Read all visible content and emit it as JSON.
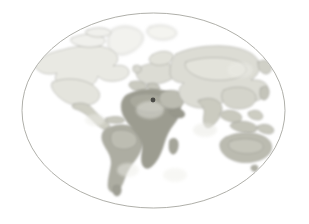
{
  "figure": {
    "kind": "world-map",
    "projection": "elliptical",
    "style": "watercolor-grayscale",
    "canvas": {
      "width": 309,
      "height": 224
    },
    "background_color": "#ffffff"
  },
  "frame": {
    "shape": "ellipse",
    "center_x": 153.5,
    "center_y": 110.5,
    "radius_x": 131.5,
    "radius_y": 97.5,
    "stroke_color": "#9a9a93",
    "stroke_width": 0.8,
    "fill": "none"
  },
  "palette": {
    "ocean": "#ffffff",
    "coastline": "#8d8d86",
    "land_faintest": "#f2f2ee",
    "land_faint": "#e8e8e2",
    "land_light": "#deded6",
    "land_medium": "#cfcfc5",
    "land_mediumdark": "#bcbcb0",
    "land_dark": "#ababa0",
    "land_darkest": "#9a9a8e",
    "marker": "#4a4a46"
  },
  "regions": [
    {
      "name": "North America",
      "tone": "land_faint",
      "tone_hex": "#e8e8e2"
    },
    {
      "name": "Greenland",
      "tone": "land_faintest",
      "tone_hex": "#f2f2ee"
    },
    {
      "name": "South America",
      "tone": "land_dark",
      "tone_hex": "#ababa0"
    },
    {
      "name": "Europe",
      "tone": "land_light",
      "tone_hex": "#deded6"
    },
    {
      "name": "Africa",
      "tone": "land_darkest",
      "tone_hex": "#9a9a8e"
    },
    {
      "name": "Asia",
      "tone": "land_light",
      "tone_hex": "#deded6"
    },
    {
      "name": "Southeast Asia",
      "tone": "land_medium",
      "tone_hex": "#cfcfc5"
    },
    {
      "name": "Australia",
      "tone": "land_mediumdark",
      "tone_hex": "#bcbcb0"
    },
    {
      "name": "Antarctica",
      "tone": "none",
      "tone_hex": "#ffffff"
    }
  ],
  "marker": {
    "label": "",
    "x": 153,
    "y": 100,
    "radius": 2.4,
    "color": "#4a4a46",
    "region_hint": "eastern Mediterranean"
  },
  "labels": {
    "title": "",
    "caption": "",
    "legend": []
  }
}
